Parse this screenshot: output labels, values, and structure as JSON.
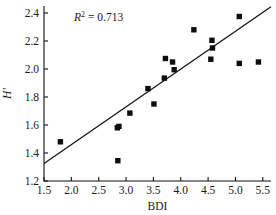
{
  "chart_data": {
    "type": "scatter",
    "title": "",
    "xlabel": "BDI",
    "ylabel": "H'",
    "xlim": [
      1.5,
      5.65
    ],
    "ylim": [
      1.2,
      2.45
    ],
    "xticks": [
      "1.5",
      "2.0",
      "2.5",
      "3.0",
      "3.5",
      "4.0",
      "4.5",
      "5.0",
      "5.5"
    ],
    "xtick_values": [
      1.5,
      2.0,
      2.5,
      3.0,
      3.5,
      4.0,
      4.5,
      5.0,
      5.5
    ],
    "yticks": [
      "1.2",
      "1.4",
      "1.6",
      "1.8",
      "2.0",
      "2.2",
      "2.4"
    ],
    "ytick_values": [
      1.2,
      1.4,
      1.6,
      1.8,
      2.0,
      2.2,
      2.4
    ],
    "grid": false,
    "legend": null,
    "annotation": {
      "text": "R2 = 0.713",
      "symbol": "R",
      "exponent": "2",
      "equals": " = ",
      "value": "0.713",
      "x": 2.05,
      "y": 2.37
    },
    "marker_style": "filled-square",
    "marker_color": "#0d0d0d",
    "points": [
      {
        "x": 1.8,
        "y": 1.48
      },
      {
        "x": 2.84,
        "y": 1.58
      },
      {
        "x": 2.87,
        "y": 1.59
      },
      {
        "x": 2.85,
        "y": 1.345
      },
      {
        "x": 3.07,
        "y": 1.685
      },
      {
        "x": 3.4,
        "y": 1.86
      },
      {
        "x": 3.51,
        "y": 1.75
      },
      {
        "x": 3.7,
        "y": 1.935
      },
      {
        "x": 3.72,
        "y": 2.075
      },
      {
        "x": 3.85,
        "y": 2.05
      },
      {
        "x": 3.88,
        "y": 1.995
      },
      {
        "x": 4.24,
        "y": 2.28
      },
      {
        "x": 4.57,
        "y": 2.205
      },
      {
        "x": 4.58,
        "y": 2.15
      },
      {
        "x": 4.55,
        "y": 2.07
      },
      {
        "x": 5.07,
        "y": 2.375
      },
      {
        "x": 5.07,
        "y": 2.04
      },
      {
        "x": 5.42,
        "y": 2.05
      }
    ],
    "trendline": {
      "x0": 1.5,
      "y0": 1.325,
      "x1": 5.65,
      "y1": 2.445,
      "color": "#111111"
    }
  }
}
